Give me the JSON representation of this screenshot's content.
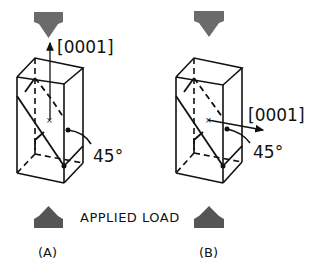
{
  "diagram": {
    "caption": "APPLIED LOAD",
    "panels": [
      {
        "label": "(A)",
        "axis_label": "[0001]",
        "angle_label": "45°",
        "axis_orientation": "vertical"
      },
      {
        "label": "(B)",
        "axis_label": "[0001]",
        "angle_label": "45°",
        "axis_orientation": "horizontal"
      }
    ],
    "colors": {
      "arrow": "#6b6b6b",
      "line": "#111111",
      "background": "#ffffff"
    }
  }
}
